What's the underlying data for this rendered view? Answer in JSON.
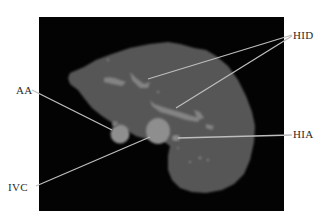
{
  "figure": {
    "background_color": "#000000",
    "organ_color": "#5c5c5c",
    "vessel_color": "#8c8c8c",
    "leader_line_color": "#b8b8b8"
  },
  "labels": [
    {
      "id": "HID",
      "text": "HID"
    },
    {
      "id": "AA",
      "text": "AA"
    },
    {
      "id": "HIA",
      "text": "HIA"
    },
    {
      "id": "IVC",
      "text": "IVC"
    }
  ]
}
